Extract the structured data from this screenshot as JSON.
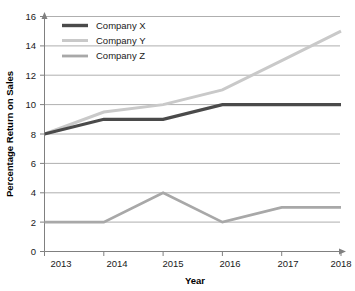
{
  "chart_data": {
    "type": "line",
    "title": "",
    "xlabel": "Year",
    "ylabel": "Percentage Return on Sales",
    "categories": [
      "2013",
      "2014",
      "2015",
      "2016",
      "2017",
      "2018"
    ],
    "x": [
      2013,
      2014,
      2015,
      2016,
      2017,
      2018
    ],
    "xlim": [
      2013,
      2018
    ],
    "ylim": [
      0,
      16
    ],
    "yticks": [
      0,
      2,
      4,
      6,
      8,
      10,
      12,
      14,
      16
    ],
    "xticks": [
      "2013",
      "2014",
      "2015",
      "2016",
      "2017",
      "2018"
    ],
    "grid": "horizontal",
    "legend_position": "top-left",
    "series": [
      {
        "name": "Company X",
        "color": "#4a4a4a",
        "width": 3.2,
        "values": [
          8,
          9,
          9,
          10,
          10,
          10
        ]
      },
      {
        "name": "Company Y",
        "color": "#c9c9c9",
        "width": 3.0,
        "values": [
          8,
          9.5,
          10,
          11,
          13,
          15
        ]
      },
      {
        "name": "Company Z",
        "color": "#a8a8a8",
        "width": 2.8,
        "values": [
          2,
          2,
          4,
          2,
          3,
          3
        ]
      }
    ]
  },
  "axes": {
    "y_tick_labels": [
      "0",
      "2",
      "4",
      "6",
      "8",
      "10",
      "12",
      "14",
      "16"
    ],
    "x_tick_labels": [
      "2013",
      "2014",
      "2015",
      "2016",
      "2017",
      "2018"
    ],
    "y_axis_title": "Percentage Return on Sales",
    "x_axis_title": "Year"
  },
  "legend": {
    "entries": [
      {
        "label": "Company X",
        "color": "#4a4a4a"
      },
      {
        "label": "Company Y",
        "color": "#c9c9c9"
      },
      {
        "label": "Company Z",
        "color": "#a8a8a8"
      }
    ]
  },
  "style": {
    "background": "#ffffff",
    "gridline_color": "#9a9a9a",
    "axis_color": "#808080",
    "text_color": "#1a1a1a"
  }
}
